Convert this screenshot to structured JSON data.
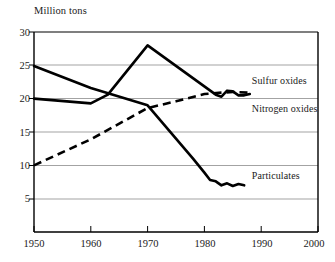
{
  "chart_data": {
    "type": "line",
    "title": "",
    "subtitle": "",
    "xlabel": "",
    "ylabel": "Million tons",
    "xlim": [
      1950,
      2000
    ],
    "ylim": [
      0,
      30
    ],
    "grid": "horizontal",
    "legend_position": "inline-right",
    "x_ticks": [
      "1950",
      "1960",
      "1970",
      "1980",
      "1990",
      "2000"
    ],
    "y_ticks": [
      "5",
      "10",
      "15",
      "20",
      "25",
      "30"
    ],
    "series": [
      {
        "name": "Sulfur oxides",
        "style": "solid",
        "color": "#000000",
        "label_x": 1988,
        "label_y": 22.6,
        "x": [
          1950,
          1960,
          1963,
          1970,
          1982,
          1983,
          1984,
          1985,
          1986,
          1987,
          1988
        ],
        "values": [
          20.0,
          19.3,
          20.6,
          28.0,
          20.6,
          20.3,
          21.2,
          21.1,
          20.5,
          20.5,
          20.7
        ]
      },
      {
        "name": "Nitrogen oxides",
        "style": "dashed",
        "color": "#000000",
        "label_x": 1988,
        "label_y": 18.4,
        "x": [
          1950,
          1960,
          1970,
          1975,
          1980,
          1983,
          1985,
          1988
        ],
        "values": [
          10.0,
          13.9,
          18.6,
          19.6,
          20.7,
          20.9,
          21.0,
          20.9
        ]
      },
      {
        "name": "Particulates",
        "style": "solid",
        "color": "#000000",
        "label_x": 1988,
        "label_y": 8.4,
        "x": [
          1950,
          1960,
          1970,
          1978,
          1980,
          1981,
          1982,
          1983,
          1984,
          1985,
          1986,
          1987
        ],
        "values": [
          24.9,
          21.6,
          19.0,
          11.0,
          8.9,
          7.8,
          7.6,
          7.0,
          7.3,
          6.9,
          7.2,
          7.0
        ]
      }
    ]
  }
}
